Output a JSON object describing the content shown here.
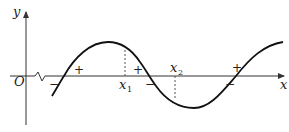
{
  "diagram": {
    "type": "function-sign-graph",
    "axes": {
      "x_label": "x",
      "y_label": "y",
      "origin_label": "O",
      "axis_break": true
    },
    "points": [
      {
        "name": "x1",
        "base": "x",
        "subscript": "1",
        "position": "below-axis",
        "dashed_to": "curve-above"
      },
      {
        "name": "x2",
        "base": "x",
        "subscript": "2",
        "position": "above-axis",
        "dashed_to": "curve-below"
      }
    ],
    "sign_marks": [
      {
        "symbol": "−",
        "location": "left of first zero"
      },
      {
        "symbol": "+",
        "location": "right of first zero"
      },
      {
        "symbol": "+",
        "location": "left of second zero"
      },
      {
        "symbol": "−",
        "location": "right of second zero"
      },
      {
        "symbol": "−",
        "location": "left of third zero"
      },
      {
        "symbol": "+",
        "location": "right of third zero"
      }
    ],
    "curve": "sinusoidal wave crossing the x-axis three times: rising, peak, falling, trough, rising",
    "colors": {
      "curve": "#111111",
      "axes": "#333333",
      "dashed": "#555555"
    }
  }
}
